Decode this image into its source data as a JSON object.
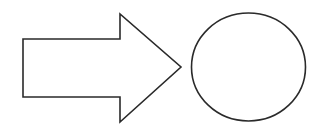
{
  "diagram": {
    "stroke_color": "#2a2a2a",
    "fill_color": "#ffffff",
    "background": "#ffffff",
    "shapes": [
      {
        "type": "block-arrow",
        "direction": "right",
        "points": "23,39 120,39 120,14 181,67 120,122 120,97 23,97"
      },
      {
        "type": "circle",
        "cx": 248.5,
        "cy": 67,
        "rx": 57,
        "ry": 54
      }
    ]
  }
}
